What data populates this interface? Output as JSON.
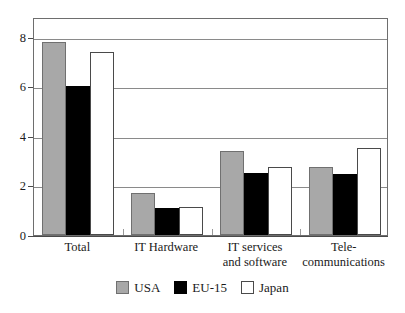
{
  "chart_data": {
    "type": "bar",
    "title": "",
    "subtitle": "",
    "xlabel": "",
    "ylabel": "",
    "ylim": [
      0,
      8.8
    ],
    "yticks": [
      0,
      2,
      4,
      6,
      8
    ],
    "ytick_labels": [
      "0",
      "2",
      "4",
      "6",
      "8"
    ],
    "grid": "horizontal",
    "gridlines_at": [
      2,
      4,
      6,
      8
    ],
    "legend_position": "bottom-center",
    "categories": [
      "Total",
      "IT Hardware",
      "IT services\nand software",
      "Tele-\ncommunications"
    ],
    "series": [
      {
        "name": "USA",
        "color": "#a8a8a8",
        "values": [
          7.8,
          1.7,
          3.4,
          2.75
        ]
      },
      {
        "name": "EU-15",
        "color": "#000000",
        "values": [
          6.0,
          1.1,
          2.5,
          2.45
        ]
      },
      {
        "name": "Japan",
        "color": "#ffffff",
        "values": [
          7.4,
          1.15,
          2.75,
          3.5
        ]
      }
    ]
  },
  "legend": {
    "items": [
      {
        "label": "USA"
      },
      {
        "label": "EU-15"
      },
      {
        "label": "Japan"
      }
    ]
  },
  "colors": {
    "usa": "#a8a8a8",
    "eu15": "#000000",
    "japan": "#ffffff",
    "axis": "#4a4a4a",
    "grid": "#8a8a8a",
    "frame": "#6e6e6e",
    "text": "#1a1a1a",
    "background": "#ffffff"
  }
}
